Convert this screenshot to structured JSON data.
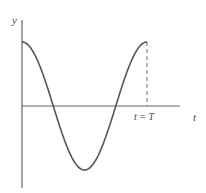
{
  "chart_data": {
    "type": "line",
    "title": "",
    "xlabel": "t",
    "ylabel": "y",
    "annotations": [
      "t = T"
    ],
    "series": [
      {
        "name": "y = A cos(2πt/T)",
        "function": "cosine",
        "periods": 1
      }
    ],
    "x": [
      0,
      0.25,
      0.5,
      0.75,
      1.0
    ],
    "values": [
      1,
      0,
      -1,
      0,
      1
    ],
    "xlim": [
      0,
      1.25
    ],
    "ylim": [
      -1,
      1
    ],
    "grid": false,
    "colors": {
      "curve": "#555555",
      "axes": "#555555"
    }
  },
  "labels": {
    "y_axis": "y",
    "t_axis": "t",
    "period_marker": "t = T"
  }
}
